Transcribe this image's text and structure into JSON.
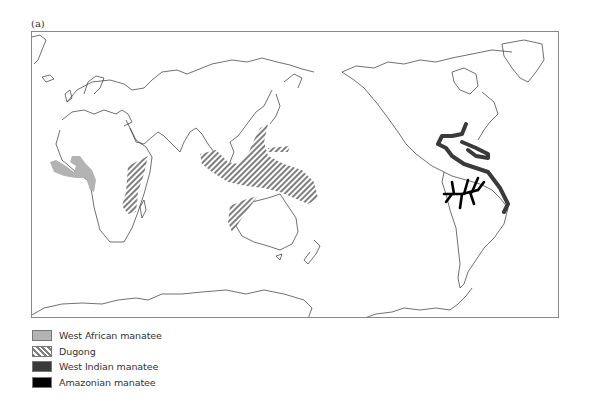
{
  "figure": {
    "panel_label": "(a)",
    "map_type": "World map, Pacific-centered projection"
  },
  "legend": {
    "items": [
      {
        "label": "West African manatee",
        "swatch": "west-african",
        "color": "#b3b3b3"
      },
      {
        "label": "Dugong",
        "swatch": "dugong",
        "color": "#7f7f7f"
      },
      {
        "label": "West Indian manatee",
        "swatch": "west-indian",
        "color": "#3a3a3a"
      },
      {
        "label": "Amazonian manatee",
        "swatch": "amazonian",
        "color": "#000000"
      }
    ]
  },
  "regions": [
    {
      "name": "West African manatee range",
      "location": "West African coast, Senegal to Angola"
    },
    {
      "name": "Dugong range",
      "location": "East Africa, Red Sea, South and Southeast Asia, Indonesia, Northern Australia, Western Pacific"
    },
    {
      "name": "West Indian manatee range",
      "location": "Southeastern US, Gulf of Mexico, Caribbean, northern South American coast to Brazil"
    },
    {
      "name": "Amazonian manatee range",
      "location": "Amazon River basin"
    }
  ]
}
